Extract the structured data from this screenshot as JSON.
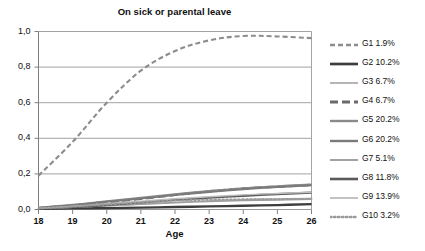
{
  "chart_data": {
    "type": "line",
    "title": "On sick or parental leave",
    "xlabel": "Age",
    "ylabel": "",
    "x": [
      18,
      19,
      20,
      21,
      22,
      23,
      24,
      25,
      26
    ],
    "xlim": [
      18,
      26
    ],
    "ylim": [
      0.0,
      1.0
    ],
    "xticks": [
      "18",
      "19",
      "20",
      "21",
      "22",
      "23",
      "24",
      "25",
      "26"
    ],
    "yticks": [
      "0,0",
      "0,2",
      "0,4",
      "0,6",
      "0,8",
      "1,0"
    ],
    "grid": "horizontal",
    "legend_position": "right",
    "decimal_separator": ",",
    "series": [
      {
        "name": "G1 1.9%",
        "group": "G1",
        "share": "1.9%",
        "style": "dashed",
        "color": "#8c8c8c",
        "width": 2.1,
        "dash": "5,3",
        "values": [
          0.19,
          0.38,
          0.6,
          0.78,
          0.89,
          0.95,
          0.975,
          0.972,
          0.963
        ]
      },
      {
        "name": "G2 10.2%",
        "group": "G2",
        "share": "10.2%",
        "style": "solid",
        "color": "#3d3d3d",
        "width": 2.3,
        "dash": "",
        "values": [
          0.004,
          0.006,
          0.008,
          0.011,
          0.014,
          0.017,
          0.021,
          0.025,
          0.03
        ]
      },
      {
        "name": "G3 6.7%",
        "group": "G3",
        "share": "6.7%",
        "style": "solid",
        "color": "#a8a8a8",
        "width": 1.3,
        "dash": "",
        "values": [
          0.006,
          0.012,
          0.02,
          0.03,
          0.04,
          0.049,
          0.055,
          0.06,
          0.063
        ]
      },
      {
        "name": "G4 6.7%",
        "group": "G4",
        "share": "6.7%",
        "style": "dashed",
        "color": "#6b6b6b",
        "width": 2.4,
        "dash": "8,4",
        "values": [
          0.008,
          0.022,
          0.04,
          0.06,
          0.082,
          0.102,
          0.118,
          0.128,
          0.138
        ]
      },
      {
        "name": "G5 20.2%",
        "group": "G5",
        "share": "20.2%",
        "style": "solid",
        "color": "#8a8a8a",
        "width": 2.0,
        "dash": "",
        "values": [
          0.01,
          0.026,
          0.046,
          0.066,
          0.086,
          0.104,
          0.12,
          0.131,
          0.141
        ]
      },
      {
        "name": "G6 20.2%",
        "group": "G6",
        "share": "20.2%",
        "style": "solid",
        "color": "#7a7a7a",
        "width": 2.0,
        "dash": "",
        "values": [
          0.009,
          0.024,
          0.043,
          0.062,
          0.081,
          0.099,
          0.114,
          0.126,
          0.136
        ]
      },
      {
        "name": "G7 5.1%",
        "group": "G7",
        "share": "5.1%",
        "style": "solid",
        "color": "#9e9e9e",
        "width": 1.5,
        "dash": "",
        "values": [
          0.005,
          0.012,
          0.021,
          0.03,
          0.038,
          0.045,
          0.05,
          0.054,
          0.058
        ]
      },
      {
        "name": "G8 11.8%",
        "group": "G8",
        "share": "11.8%",
        "style": "solid",
        "color": "#5a5a5a",
        "width": 2.2,
        "dash": "",
        "values": [
          0.006,
          0.014,
          0.026,
          0.04,
          0.054,
          0.066,
          0.077,
          0.086,
          0.095
        ]
      },
      {
        "name": "G9 13.9%",
        "group": "G9",
        "share": "13.9%",
        "style": "solid",
        "color": "#bdbdbd",
        "width": 1.4,
        "dash": "",
        "values": [
          0.007,
          0.018,
          0.032,
          0.046,
          0.06,
          0.072,
          0.082,
          0.09,
          0.097
        ]
      },
      {
        "name": "G10 3.2%",
        "group": "G10",
        "share": "3.2%",
        "style": "dotted",
        "color": "#9a9a9a",
        "width": 2.0,
        "dash": "1.5,2.5",
        "values": [
          0.006,
          0.016,
          0.028,
          0.04,
          0.05,
          0.055,
          0.057,
          0.058,
          0.06
        ]
      }
    ]
  }
}
